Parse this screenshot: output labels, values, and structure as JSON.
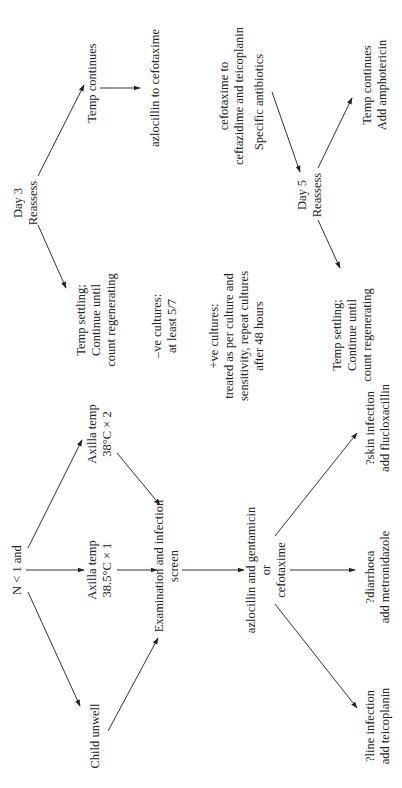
{
  "diagram": {
    "orientation": "rotated-90-ccw",
    "nodes": {
      "start": {
        "lines": [
          "N < 1 and"
        ]
      },
      "child_unwell": {
        "lines": [
          "Child unwell"
        ]
      },
      "axilla_385": {
        "lines": [
          "Axilla temp",
          "38.5°C × 1"
        ]
      },
      "axilla_38": {
        "lines": [
          "Axilla temp",
          "38°C × 2"
        ]
      },
      "exam": {
        "lines": [
          "Examination and infection",
          "screen"
        ]
      },
      "initial_abx": {
        "lines": [
          "azlocillin and gentamicin",
          "or",
          "cefotaxime"
        ]
      },
      "line_infection": {
        "lines": [
          "?line infection",
          "add teicoplanin"
        ]
      },
      "diarrhoea": {
        "lines": [
          "?diarrhoea",
          "add metronidazole"
        ]
      },
      "skin_infection": {
        "lines": [
          "?skin infection",
          "add flucloxacillin"
        ]
      },
      "day3": {
        "lines": [
          "Day 3",
          "Reassess"
        ]
      },
      "day3_settling": {
        "lines": [
          "Temp settling;",
          "Continue until",
          "count regenerating"
        ]
      },
      "day3_continues": {
        "lines": [
          "Temp continues"
        ]
      },
      "switch_azlo": {
        "lines": [
          "azlocillin to cefotaxime"
        ]
      },
      "neg_cultures": {
        "lines": [
          "–ve cultures:",
          "at least 5/7"
        ]
      },
      "pos_cultures": {
        "lines": [
          "+ve cultures:",
          "treated as per culture and",
          "sensitivity, repeat cultures",
          "after 48 hours"
        ]
      },
      "switch_cefo": {
        "lines": [
          "cefotaxime to",
          "ceftazidime and teicoplanin"
        ]
      },
      "specific_abx": {
        "lines": [
          "Specific antibiotics"
        ]
      },
      "day5": {
        "lines": [
          "Day 5",
          "Reassess"
        ]
      },
      "day5_settling": {
        "lines": [
          "Temp settling;",
          "Continue until",
          "count regenerating"
        ]
      },
      "day5_continues": {
        "lines": [
          "Temp continues",
          "Add amphotericin"
        ]
      }
    },
    "edges": [
      [
        "start",
        "child_unwell"
      ],
      [
        "start",
        "axilla_385"
      ],
      [
        "start",
        "axilla_38"
      ],
      [
        "child_unwell",
        "exam"
      ],
      [
        "axilla_385",
        "exam"
      ],
      [
        "axilla_38",
        "exam"
      ],
      [
        "exam",
        "initial_abx"
      ],
      [
        "initial_abx",
        "line_infection"
      ],
      [
        "initial_abx",
        "diarrhoea"
      ],
      [
        "initial_abx",
        "skin_infection"
      ],
      [
        "day3",
        "day3_settling"
      ],
      [
        "day3",
        "day3_continues"
      ],
      [
        "day3_continues",
        "switch_azlo"
      ],
      [
        "specific_abx",
        "day5"
      ],
      [
        "day5",
        "day5_settling"
      ],
      [
        "day5",
        "day5_continues"
      ]
    ],
    "colors": {
      "text": "#222222",
      "line": "#333333",
      "background": "#ffffff"
    }
  }
}
